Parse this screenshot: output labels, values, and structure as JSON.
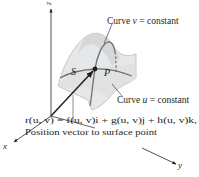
{
  "figure": {
    "axes": {
      "x_label": "x",
      "y_label": "y",
      "z_label": "z"
    },
    "surface_label": "S",
    "point_label": "P",
    "curve_v_label": "Curve v = constant",
    "curve_v_parts": {
      "prefix": "Curve ",
      "var": "v",
      "suffix": " = constant"
    },
    "curve_u_label": "Curve u = constant",
    "curve_u_parts": {
      "prefix": "Curve ",
      "var": "u",
      "suffix": " = constant"
    },
    "equation": "r(u, v) = f(u, v)i + g(u, v)j + h(u, v)k,",
    "caption": "Position vector to surface point",
    "colors": {
      "surface_fill": "#e6e7e8",
      "surface_shade": "#c9cacc",
      "curve": "#6d6e71",
      "axis": "#231f20",
      "text": "#231f20"
    }
  }
}
